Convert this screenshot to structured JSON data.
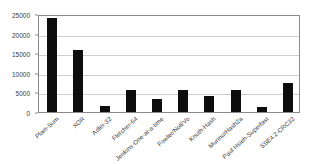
{
  "chart_data": {
    "type": "bar",
    "title": "",
    "subtitle": "",
    "xlabel": "",
    "ylabel": "",
    "ylim": [
      0,
      25000
    ],
    "yticks": [
      0,
      5000,
      10000,
      15000,
      20000,
      25000
    ],
    "ytick_labels": [
      "0",
      "5000",
      "10000",
      "15000",
      "20000",
      "25000"
    ],
    "grid": true,
    "legend": false,
    "legend_position": "none",
    "bar_color": "#0d0d0d",
    "categories": [
      "Plain-Sum",
      "XOR",
      "Adler-32",
      "Fletcher-64",
      "Jenkins-One-at-a-time",
      "Fowler/Noll/Vo",
      "Knuth-Hash",
      "MurmurHash2a",
      "Paul Hsieh-Superfast",
      "SSE4.2-CRC32"
    ],
    "values": [
      24000,
      15700,
      1600,
      5700,
      3200,
      5650,
      4100,
      5500,
      1200,
      7400
    ]
  },
  "colors": {
    "bar": "#0d0d0d",
    "grid": "#cfcfcf",
    "axis": "#8a8a8a",
    "text": "#3a3a3a",
    "background": "#ffffff"
  }
}
